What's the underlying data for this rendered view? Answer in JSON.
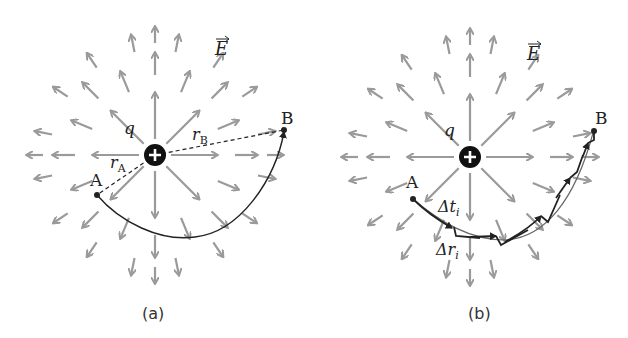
{
  "panels": [
    {
      "id": "a",
      "caption": "(a)",
      "charge_label": "q",
      "charge_sign": "+",
      "field_label": "E",
      "point_a_label": "A",
      "point_b_label": "B",
      "radius_a_label": "r",
      "radius_a_sub": "A",
      "radius_b_label": "r",
      "radius_b_sub": "B"
    },
    {
      "id": "b",
      "caption": "(b)",
      "charge_label": "q",
      "charge_sign": "+",
      "field_label": "E",
      "point_a_label": "A",
      "point_b_label": "B",
      "delta_t_label": "Δt",
      "delta_t_sub": "i",
      "delta_r_label": "Δr",
      "delta_r_sub": "i"
    }
  ],
  "colors": {
    "field_arrow": "#9a9a9a",
    "path": "#222222",
    "charge_fill": "#111111",
    "charge_sign": "#ffffff"
  }
}
